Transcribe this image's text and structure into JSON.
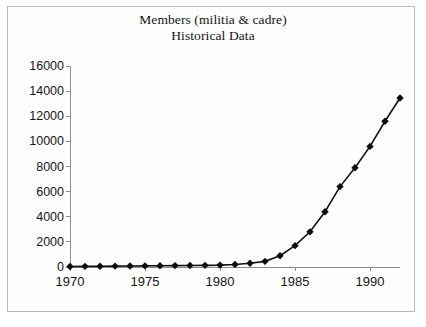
{
  "chart_data": {
    "type": "line",
    "title": "Members (militia & cadre)",
    "subtitle": "Historical Data",
    "xlabel": "",
    "ylabel": "",
    "xlim": [
      1970,
      1992
    ],
    "ylim": [
      0,
      16000
    ],
    "grid": false,
    "legend": null,
    "marker": "diamond",
    "x_ticks": [
      1970,
      1975,
      1980,
      1985,
      1990
    ],
    "y_ticks": [
      0,
      2000,
      4000,
      6000,
      8000,
      10000,
      12000,
      14000,
      16000
    ],
    "x": [
      1970,
      1971,
      1972,
      1973,
      1974,
      1975,
      1976,
      1977,
      1978,
      1979,
      1980,
      1981,
      1982,
      1983,
      1984,
      1985,
      1986,
      1987,
      1988,
      1989,
      1990,
      1991,
      1992
    ],
    "values": [
      40,
      50,
      60,
      70,
      80,
      90,
      100,
      110,
      120,
      130,
      150,
      200,
      300,
      450,
      900,
      1700,
      2800,
      4400,
      6400,
      7900,
      9600,
      11600,
      13450
    ],
    "series": [
      {
        "name": "Members (militia & cadre)",
        "values": [
          40,
          50,
          60,
          70,
          80,
          90,
          100,
          110,
          120,
          130,
          150,
          200,
          300,
          450,
          900,
          1700,
          2800,
          4400,
          6400,
          7900,
          9600,
          11600,
          13450
        ]
      }
    ]
  },
  "chart": {
    "title": "Members (militia & cadre)",
    "subtitle": "Historical Data"
  }
}
